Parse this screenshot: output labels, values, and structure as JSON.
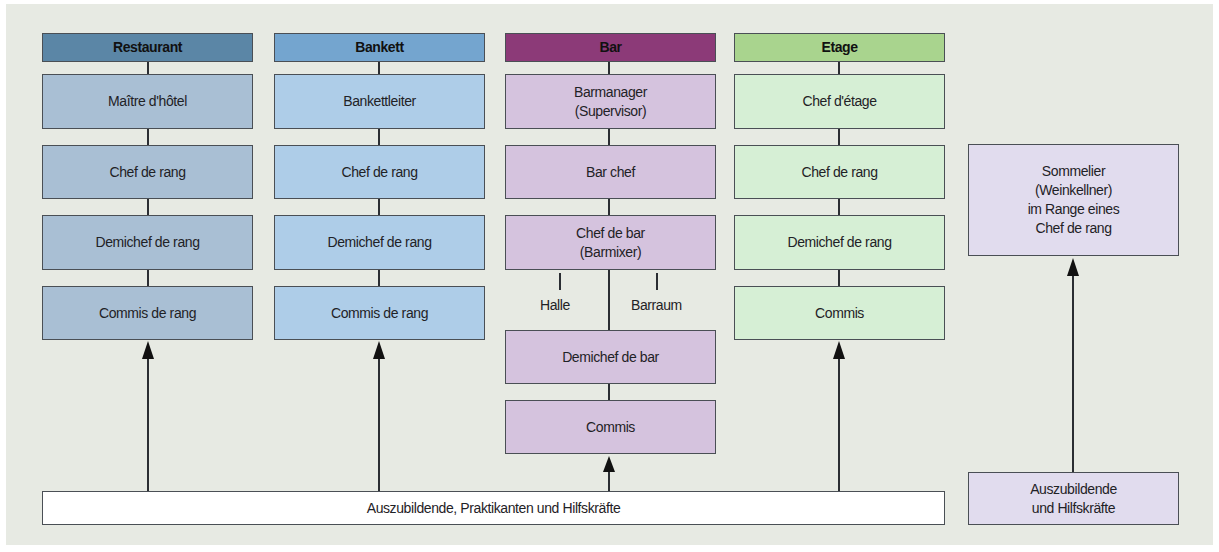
{
  "colors": {
    "background": "#e7eae3",
    "restaurant_header": "#5b86a6",
    "restaurant_box": "#a9bfd4",
    "bankett_header": "#74a5cf",
    "bankett_box": "#aecde8",
    "bar_header": "#8c3a78",
    "bar_box": "#d5c3de",
    "etage_header": "#a9d48e",
    "etage_box": "#d6efd5",
    "sommelier_box": "#e1dcee",
    "trainee_box": "#ffffff"
  },
  "columns": [
    {
      "header": "Restaurant",
      "roles": [
        "Maître d'hôtel",
        "Chef de rang",
        "Demichef de rang",
        "Commis de rang"
      ]
    },
    {
      "header": "Bankett",
      "roles": [
        "Bankettleiter",
        "Chef de rang",
        "Demichef de rang",
        "Commis de rang"
      ]
    },
    {
      "header": "Bar",
      "roles": [
        "Barmanager (Supervisor)",
        "Bar chef",
        "Chef de bar (Barmixer)",
        "Demichef de bar",
        "Commis"
      ],
      "branches": [
        "Halle",
        "Barraum"
      ]
    },
    {
      "header": "Etage",
      "roles": [
        "Chef d'étage",
        "Chef de rang",
        "Demichef de rang",
        "Commis"
      ]
    }
  ],
  "bar_roles_lines": {
    "barmanager_1": "Barmanager",
    "barmanager_2": "(Supervisor)",
    "chefdebar_1": "Chef de bar",
    "chefdebar_2": "(Barmixer)"
  },
  "sommelier": {
    "line1": "Sommelier",
    "line2": "(Weinkellner)",
    "line3": "im Range eines",
    "line4": "Chef de rang"
  },
  "trainees_main": "Auszubildende, Praktikanten und Hilfskräfte",
  "trainees_side": {
    "line1": "Auszubildende",
    "line2": "und Hilfskräfte"
  }
}
